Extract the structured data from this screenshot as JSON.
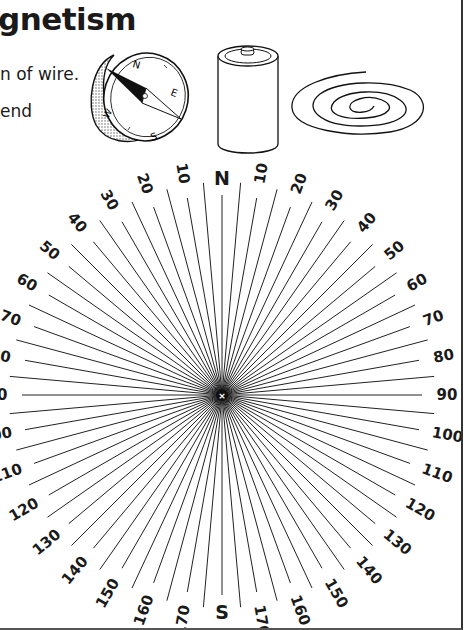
{
  "header": {
    "title": "gnetism",
    "instructions": [
      "n of wire.",
      "end"
    ]
  },
  "illustrations": [
    {
      "name": "compass",
      "labels": [
        "N",
        "E",
        "S",
        "W"
      ]
    },
    {
      "name": "battery"
    },
    {
      "name": "coil-of-wire"
    }
  ],
  "compass_rose": {
    "center": [
      222,
      395
    ],
    "line_step_degrees": 5,
    "label_step_degrees": 10,
    "labeled_line_radius": 200,
    "unlabeled_line_radius": 213,
    "label_radius": 217,
    "cardinals": {
      "0": "N",
      "180": "S"
    },
    "labels": [
      {
        "angle": 0,
        "text": "N"
      },
      {
        "angle": 10,
        "text": "10"
      },
      {
        "angle": 20,
        "text": "20"
      },
      {
        "angle": 30,
        "text": "30"
      },
      {
        "angle": 40,
        "text": "40"
      },
      {
        "angle": 50,
        "text": "50"
      },
      {
        "angle": 60,
        "text": "60"
      },
      {
        "angle": 70,
        "text": "70"
      },
      {
        "angle": 80,
        "text": "80"
      },
      {
        "angle": 90,
        "text": "90"
      },
      {
        "angle": 100,
        "text": "100"
      },
      {
        "angle": 110,
        "text": "110"
      },
      {
        "angle": 120,
        "text": "120"
      },
      {
        "angle": 130,
        "text": "130"
      },
      {
        "angle": 140,
        "text": "140"
      },
      {
        "angle": 150,
        "text": "150"
      },
      {
        "angle": 160,
        "text": "160"
      },
      {
        "angle": 170,
        "text": "170"
      },
      {
        "angle": 180,
        "text": "S"
      },
      {
        "angle": 190,
        "text": "170"
      },
      {
        "angle": 200,
        "text": "160"
      },
      {
        "angle": 210,
        "text": "150"
      },
      {
        "angle": 220,
        "text": "140"
      },
      {
        "angle": 230,
        "text": "130"
      },
      {
        "angle": 240,
        "text": "120"
      },
      {
        "angle": 250,
        "text": "110"
      },
      {
        "angle": 260,
        "text": "100"
      },
      {
        "angle": 270,
        "text": "90"
      },
      {
        "angle": 280,
        "text": "80"
      },
      {
        "angle": 290,
        "text": "70"
      },
      {
        "angle": 300,
        "text": "60"
      },
      {
        "angle": 310,
        "text": "50"
      },
      {
        "angle": 320,
        "text": "40"
      },
      {
        "angle": 330,
        "text": "30"
      },
      {
        "angle": 340,
        "text": "20"
      },
      {
        "angle": 350,
        "text": "10"
      }
    ],
    "center_mark": "×"
  }
}
